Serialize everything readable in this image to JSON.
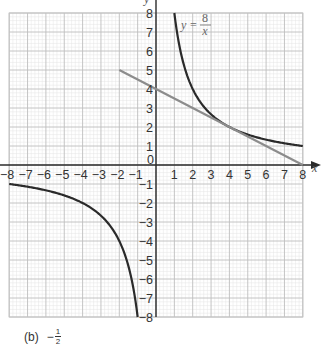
{
  "chart_data": {
    "type": "line",
    "title": "",
    "xlabel": "x",
    "ylabel": "y",
    "xlim": [
      -8,
      8
    ],
    "ylim": [
      -8,
      8
    ],
    "grid": true,
    "grid_major_step": 1,
    "grid_minor_step": 0.2,
    "x_ticks": [
      "-8",
      "-7",
      "-6",
      "-5",
      "-4",
      "-3",
      "-2",
      "-1",
      "0",
      "1",
      "2",
      "3",
      "4",
      "5",
      "6",
      "7",
      "8"
    ],
    "y_ticks": [
      "8",
      "7",
      "6",
      "5",
      "4",
      "3",
      "2",
      "1",
      "-1",
      "-2",
      "-3",
      "-4",
      "-5",
      "-6",
      "-7",
      "-8"
    ],
    "series": [
      {
        "name": "y = 8/x",
        "kind": "hyperbola",
        "color": "#2a2a2a",
        "branches": [
          {
            "x_range": [
              1,
              8
            ],
            "points": [
              [
                1,
                8
              ],
              [
                2,
                4
              ],
              [
                4,
                2
              ],
              [
                8,
                1
              ]
            ]
          },
          {
            "x_range": [
              -8,
              -1
            ],
            "points": [
              [
                -8,
                -1
              ],
              [
                -4,
                -2
              ],
              [
                -2,
                -4
              ],
              [
                -1,
                -8
              ]
            ]
          }
        ]
      },
      {
        "name": "tangent line",
        "kind": "line",
        "color": "#8c8c8c",
        "points": [
          [
            -2,
            5
          ],
          [
            0,
            4
          ],
          [
            4,
            2
          ],
          [
            8,
            0
          ]
        ]
      }
    ],
    "annotations": [
      {
        "text": "y = 8/x",
        "at": [
          1.3,
          7.4
        ]
      }
    ]
  },
  "labels": {
    "x_axis": "x",
    "y_axis": "y",
    "origin": "0",
    "func_lhs": "y =",
    "func_num": "8",
    "func_den": "x"
  },
  "answer": {
    "part": "(b)",
    "sign": "−",
    "numerator": "1",
    "denominator": "2"
  },
  "colors": {
    "curve": "#2a2a2a",
    "line": "#8c8c8c",
    "grid_major": "#bdbdbd",
    "grid_minor": "#e4e4e4",
    "axis": "#2b2b2b"
  }
}
